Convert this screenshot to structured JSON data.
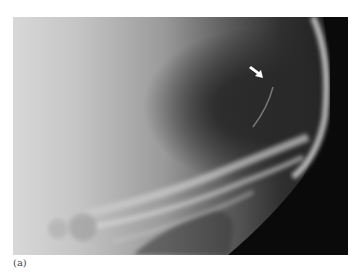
{
  "figure": {
    "label": "(a)",
    "annotation": {
      "type": "arrow",
      "color": "#ffffff",
      "icon": "arrow-down-right-icon"
    }
  }
}
